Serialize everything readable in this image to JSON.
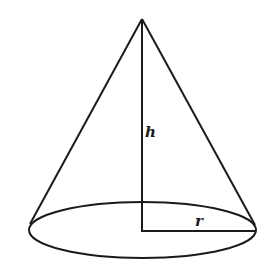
{
  "diagram": {
    "type": "right-circular-cone",
    "stroke_color": "#1a1a1a",
    "background": "#ffffff",
    "labels": {
      "height": "h",
      "radius": "r"
    }
  }
}
